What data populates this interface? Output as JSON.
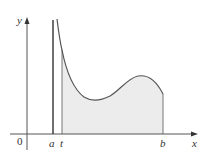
{
  "diagram": {
    "type": "improper-integral-region",
    "axes": {
      "x_label": "x",
      "y_label": "y",
      "origin_label": "0"
    },
    "marks": {
      "a_label": "a",
      "t_label": "t",
      "b_label": "b"
    },
    "colors": {
      "axis": "#555555",
      "curve": "#555555",
      "asymptote": "#333333",
      "shade": "#ececec",
      "text": "#333333"
    }
  }
}
